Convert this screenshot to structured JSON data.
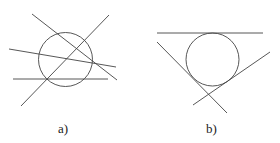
{
  "figure": {
    "stroke_color": "#444444",
    "panels": [
      {
        "label": "a)",
        "description": "Circle crossed by four lines in general position",
        "circle": {
          "cx": 65.5,
          "cy": 59.5,
          "r": 27
        },
        "lines": [
          {
            "x1": 32,
            "y1": 14,
            "x2": 117,
            "y2": 80
          },
          {
            "x1": 21,
            "y1": 106,
            "x2": 109,
            "y2": 15
          },
          {
            "x1": 9,
            "y1": 49,
            "x2": 116,
            "y2": 67
          },
          {
            "x1": 13,
            "y1": 79,
            "x2": 108,
            "y2": 79
          }
        ],
        "label_pos": {
          "x": 58,
          "y": 133
        }
      },
      {
        "label": "b)",
        "description": "Circle tangent to three lines",
        "circle": {
          "cx": 212.5,
          "cy": 59.5,
          "r": 26.5
        },
        "lines": [
          {
            "x1": 157,
            "y1": 33,
            "x2": 263,
            "y2": 33
          },
          {
            "x1": 157,
            "y1": 42,
            "x2": 227,
            "y2": 113
          },
          {
            "x1": 193,
            "y1": 105,
            "x2": 270,
            "y2": 52
          }
        ],
        "label_pos": {
          "x": 206,
          "y": 133
        }
      }
    ]
  }
}
